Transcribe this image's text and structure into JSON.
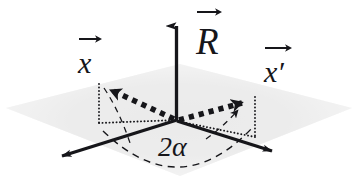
{
  "figure": {
    "type": "3d-vector-diagram",
    "background_color": "#ffffff",
    "plane_color": "#ededed",
    "ink_color": "#16161a"
  },
  "labels": {
    "axis_vector": "R",
    "vector_initial": "x",
    "vector_rotated": "x",
    "vector_rotated_prime": "′",
    "angle": "2α"
  },
  "elements": {
    "plane_name": "horizontal-plane",
    "origin": {
      "x": 177,
      "y": 120
    },
    "axis_up": {
      "name": "R-axis-arrow",
      "from": [
        177,
        120
      ],
      "to": [
        177,
        14
      ]
    },
    "axis_left": {
      "name": "left-axis-arrow",
      "from": [
        177,
        120
      ],
      "to": [
        57,
        157
      ]
    },
    "axis_right": {
      "name": "right-axis-arrow",
      "from": [
        177,
        120
      ],
      "to": [
        276,
        152
      ]
    },
    "vector_x": {
      "name": "vector-x-dotted",
      "from": [
        177,
        120
      ],
      "to": [
        104,
        86
      ]
    },
    "vector_xprime": {
      "name": "vector-x-prime-dotted",
      "from": [
        177,
        120
      ],
      "to": [
        249,
        100
      ]
    },
    "angle_arc": {
      "name": "angle-arc-2alpha",
      "value": "2α"
    }
  }
}
